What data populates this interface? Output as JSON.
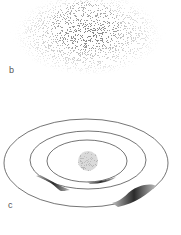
{
  "panels": [
    {
      "label": "b",
      "description": "diffuse speckled particle cloud (density distribution)"
    },
    {
      "label": "c",
      "description": "three concentric elliptical orbits around a central sphere, with shaded wave segments on the rings"
    }
  ],
  "colors": {
    "line": "#3a3a3a",
    "cloud": "#6e6e6e",
    "sphere": "#b5b5b5",
    "wave": "#2e2e2e",
    "label": "#555555"
  }
}
